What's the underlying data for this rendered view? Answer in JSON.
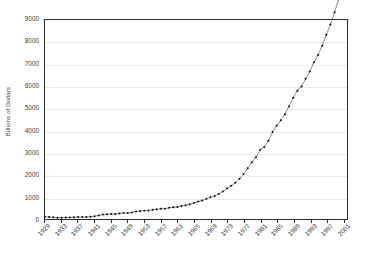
{
  "chart_data": {
    "type": "line",
    "title": "",
    "subtitle": "",
    "xlabel": "",
    "ylabel": "Billions of Dollars",
    "ylim": [
      0,
      9000
    ],
    "ytick_values": [
      0,
      1000,
      2000,
      3000,
      4000,
      5000,
      6000,
      7000,
      8000,
      9000
    ],
    "ytick_labels": [
      "0",
      "1000",
      "2000",
      "3000",
      "4000",
      "5000",
      "6000",
      "7000",
      "8000",
      "9000"
    ],
    "xlim": [
      1929,
      2002
    ],
    "xtick_labels": [
      "1929",
      "1933",
      "1937",
      "1941",
      "1945",
      "1949",
      "1953",
      "1957",
      "1961",
      "1965",
      "1969",
      "1973",
      "1977",
      "1981",
      "1985",
      "1989",
      "1993",
      "1997",
      "2001"
    ],
    "xtick_values": [
      1929,
      1933,
      1937,
      1941,
      1945,
      1949,
      1953,
      1957,
      1961,
      1965,
      1969,
      1973,
      1977,
      1981,
      1985,
      1989,
      1993,
      1997,
      2001
    ],
    "grid": true,
    "grid_axis": "y",
    "legend": false,
    "legend_position": "none",
    "marker": "diamond",
    "marker_color": "#111111",
    "line_color": "#555555",
    "series": [
      {
        "name": "Billions of Dollars",
        "x": [
          1929,
          1930,
          1931,
          1932,
          1933,
          1934,
          1935,
          1936,
          1937,
          1938,
          1939,
          1940,
          1941,
          1942,
          1943,
          1944,
          1945,
          1946,
          1947,
          1948,
          1949,
          1950,
          1951,
          1952,
          1953,
          1954,
          1955,
          1956,
          1957,
          1958,
          1959,
          1960,
          1961,
          1962,
          1963,
          1964,
          1965,
          1966,
          1967,
          1968,
          1969,
          1970,
          1971,
          1972,
          1973,
          1974,
          1975,
          1976,
          1977,
          1978,
          1979,
          1980,
          1981,
          1982,
          1983,
          1984,
          1985,
          1986,
          1987,
          1988,
          1989,
          1990,
          1991,
          1992,
          1993,
          1994,
          1995,
          1996,
          1997,
          1998,
          1999,
          2000,
          2001,
          2002
        ],
        "values": [
          103,
          91,
          77,
          59,
          57,
          66,
          73,
          83,
          92,
          86,
          92,
          101,
          127,
          162,
          199,
          219,
          223,
          222,
          244,
          270,
          268,
          294,
          339,
          358,
          379,
          380,
          415,
          438,
          461,
          467,
          507,
          527,
          545,
          586,
          618,
          664,
          720,
          788,
          833,
          910,
          985,
          1039,
          1128,
          1240,
          1385,
          1501,
          1635,
          1824,
          2030,
          2294,
          2563,
          2790,
          3128,
          3255,
          3537,
          3933,
          4220,
          4463,
          4740,
          5104,
          5484,
          5803,
          5996,
          6338,
          6667,
          7085,
          7415,
          7839,
          8332,
          8794,
          9354,
          9952,
          10286,
          10642
        ]
      }
    ]
  }
}
